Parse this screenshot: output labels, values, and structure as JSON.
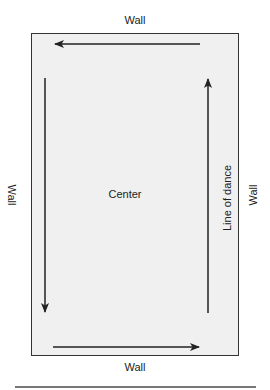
{
  "diagram": {
    "labels": {
      "top_wall": "Wall",
      "bottom_wall": "Wall",
      "left_wall": "Wall",
      "right_wall": "Wall",
      "center": "Center",
      "line_of_dance": "Line of dance"
    },
    "arrows": [
      {
        "name": "top-arrow",
        "direction": "left"
      },
      {
        "name": "left-arrow",
        "direction": "down"
      },
      {
        "name": "bottom-arrow",
        "direction": "right"
      },
      {
        "name": "right-arrow",
        "direction": "up"
      }
    ],
    "colors": {
      "floor": "#f0f0f0",
      "stroke": "#222222",
      "rule": "#777777"
    }
  }
}
